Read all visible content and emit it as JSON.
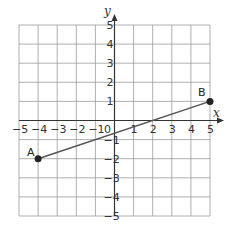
{
  "chart_data": {
    "type": "line",
    "title": "",
    "xlabel": "x",
    "ylabel": "y",
    "xlim": [
      -5,
      5
    ],
    "ylim": [
      -5,
      5
    ],
    "grid": true,
    "x_ticks": [
      "−5",
      "−4",
      "−3",
      "−2",
      "−1",
      "0",
      "1",
      "2",
      "3",
      "4",
      "5"
    ],
    "y_ticks": [
      "5",
      "4",
      "3",
      "2",
      "1",
      "−1",
      "−2",
      "−3",
      "−4",
      "−5"
    ],
    "origin_label": "0",
    "series": [
      {
        "name": "segment AB",
        "points": [
          {
            "label": "A",
            "x": -4,
            "y": -2
          },
          {
            "label": "B",
            "x": 5,
            "y": 1
          }
        ]
      }
    ],
    "colors": {
      "grid": "#9a9a9a",
      "axis": "#333333",
      "segment": "#555555",
      "point": "#222222"
    }
  },
  "labels": {
    "x_axis": "x",
    "y_axis": "y",
    "point_a": "A",
    "point_b": "B",
    "origin": "0"
  }
}
